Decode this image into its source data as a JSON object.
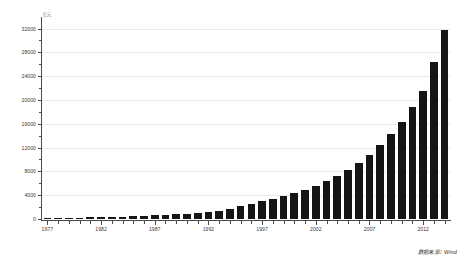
{
  "chart_data": {
    "type": "bar",
    "title": "",
    "subtitle": "",
    "xlabel": "",
    "ylabel": "",
    "unit": "亿元",
    "ylim": [
      0,
      33600
    ],
    "ytick_values": [
      0,
      4000,
      8000,
      12000,
      16000,
      20000,
      24000,
      28000,
      32000
    ],
    "ytick_labels": [
      "0",
      "4000",
      "8000",
      "12000",
      "16000",
      "20000",
      "24000",
      "28000",
      "32000"
    ],
    "grid": true,
    "grid_axis": "y",
    "legend": false,
    "legend_position": "none",
    "bar_color": "#151515",
    "categories": [
      "1977",
      "1978",
      "1979",
      "1980",
      "1981",
      "1982",
      "1983",
      "1984",
      "1985",
      "1986",
      "1987",
      "1988",
      "1989",
      "1990",
      "1991",
      "1992",
      "1993",
      "1994",
      "1995",
      "1996",
      "1997",
      "1998",
      "1999",
      "2000",
      "2001",
      "2002",
      "2003",
      "2004",
      "2005",
      "2006",
      "2007",
      "2008",
      "2009",
      "2010",
      "2011",
      "2012",
      "2013",
      "2014"
    ],
    "values": [
      170,
      190,
      210,
      240,
      270,
      300,
      340,
      390,
      450,
      520,
      600,
      700,
      760,
      820,
      950,
      1150,
      1400,
      1750,
      2200,
      2600,
      3000,
      3400,
      3800,
      4300,
      4900,
      5600,
      6400,
      7200,
      8200,
      9400,
      10800,
      12400,
      14200,
      16300,
      18800,
      21500,
      26400,
      31800
    ],
    "xtick_major_labels": [
      "1977",
      "1982",
      "1987",
      "1992",
      "1997",
      "2002",
      "2007",
      "2012"
    ],
    "xtick_major_categories": [
      "1977",
      "1982",
      "1987",
      "1992",
      "1997",
      "2002",
      "2007",
      "2012"
    ]
  },
  "source": {
    "label": "数据来源：",
    "value": "Wind"
  }
}
